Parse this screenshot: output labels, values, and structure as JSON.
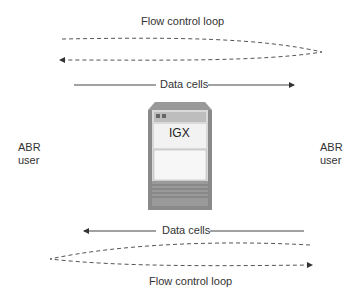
{
  "diagram": {
    "top_loop_label": "Flow control loop",
    "top_data_label": "Data cells",
    "device_label": "IGX",
    "left_label_line1": "ABR",
    "left_label_line2": "user",
    "right_label_line1": "ABR",
    "right_label_line2": "user",
    "bottom_data_label": "Data cells",
    "bottom_loop_label": "Flow control loop"
  }
}
